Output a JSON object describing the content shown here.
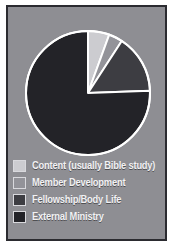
{
  "figure": {
    "background_color": "#8e8e93",
    "border_color": "#2b2b30",
    "outline_color": "#ffffff"
  },
  "chart_data": {
    "type": "pie",
    "title": "",
    "xlabel": "",
    "ylabel": "",
    "grid": false,
    "legend_position": "bottom-left",
    "start_angle_deg": 0,
    "direction": "clockwise",
    "categories": [
      "Content (usually Bible study)",
      "Member Development",
      "Fellowship/Body Life",
      "External Ministry"
    ],
    "values": [
      5.6,
      3.6,
      15.3,
      75.5
    ],
    "angles_deg": [
      20,
      13,
      55,
      272
    ],
    "colors": [
      "#ccccd0",
      "#939399",
      "#3d3d42",
      "#232328"
    ],
    "slices": [
      {
        "label": "Content (usually Bible study)",
        "value": 5.6,
        "angle_deg": 20,
        "color": "#ccccd0"
      },
      {
        "label": "Member Development",
        "value": 3.6,
        "angle_deg": 13,
        "color": "#939399"
      },
      {
        "label": "Fellowship/Body Life",
        "value": 15.3,
        "angle_deg": 55,
        "color": "#3d3d42"
      },
      {
        "label": "External Ministry",
        "value": 75.5,
        "angle_deg": 272,
        "color": "#232328"
      }
    ]
  },
  "legend": {
    "items": [
      {
        "label": "Content (usually Bible study)",
        "color": "#ccccd0"
      },
      {
        "label": "Member Development",
        "color": "#939399"
      },
      {
        "label": "Fellowship/Body Life",
        "color": "#3d3d42"
      },
      {
        "label": "External Ministry",
        "color": "#232328"
      }
    ]
  }
}
